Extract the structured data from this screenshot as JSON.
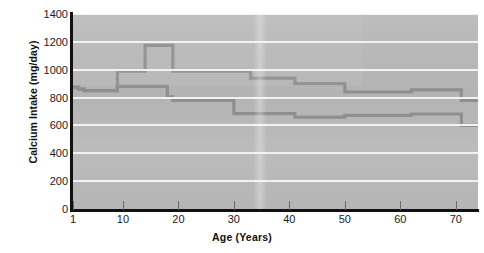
{
  "chart_data": {
    "type": "line",
    "title": "",
    "xlabel": "Age (Years)",
    "ylabel": "Calcium Intake (mg/day)",
    "xlim": [
      1,
      74
    ],
    "ylim": [
      0,
      1400
    ],
    "xticks": [
      1,
      10,
      20,
      30,
      40,
      50,
      60,
      70
    ],
    "xtick_labels": [
      "1",
      "10",
      "20",
      "30",
      "40",
      "50",
      "60",
      "70"
    ],
    "yticks": [
      0,
      200,
      400,
      600,
      800,
      1000,
      1200,
      1400
    ],
    "ytick_labels": [
      "0",
      "200",
      "400",
      "600",
      "800",
      "1000",
      "1200",
      "1400"
    ],
    "grid": "horizontal",
    "legend": "none",
    "style": "step",
    "plot_background": "#b9b9b9",
    "gridline_color": "#f2f2f2",
    "series": [
      {
        "name": "upper-curve",
        "color": "#8f8f8f",
        "x": [
          1,
          2,
          3,
          4,
          8,
          9,
          13,
          14,
          18,
          19,
          32,
          33,
          40,
          41,
          49,
          50,
          61,
          62,
          70,
          71,
          74
        ],
        "values": [
          875,
          860,
          850,
          850,
          850,
          990,
          990,
          1175,
          1175,
          990,
          990,
          940,
          940,
          900,
          900,
          840,
          840,
          855,
          855,
          780,
          780
        ]
      },
      {
        "name": "lower-curve",
        "color": "#8f8f8f",
        "x": [
          1,
          2,
          3,
          4,
          8,
          9,
          17,
          18,
          19,
          29,
          30,
          40,
          41,
          49,
          50,
          61,
          62,
          70,
          71,
          74
        ],
        "values": [
          875,
          860,
          850,
          850,
          850,
          880,
          880,
          805,
          780,
          780,
          685,
          685,
          660,
          660,
          672,
          672,
          682,
          682,
          600,
          600
        ]
      }
    ]
  }
}
